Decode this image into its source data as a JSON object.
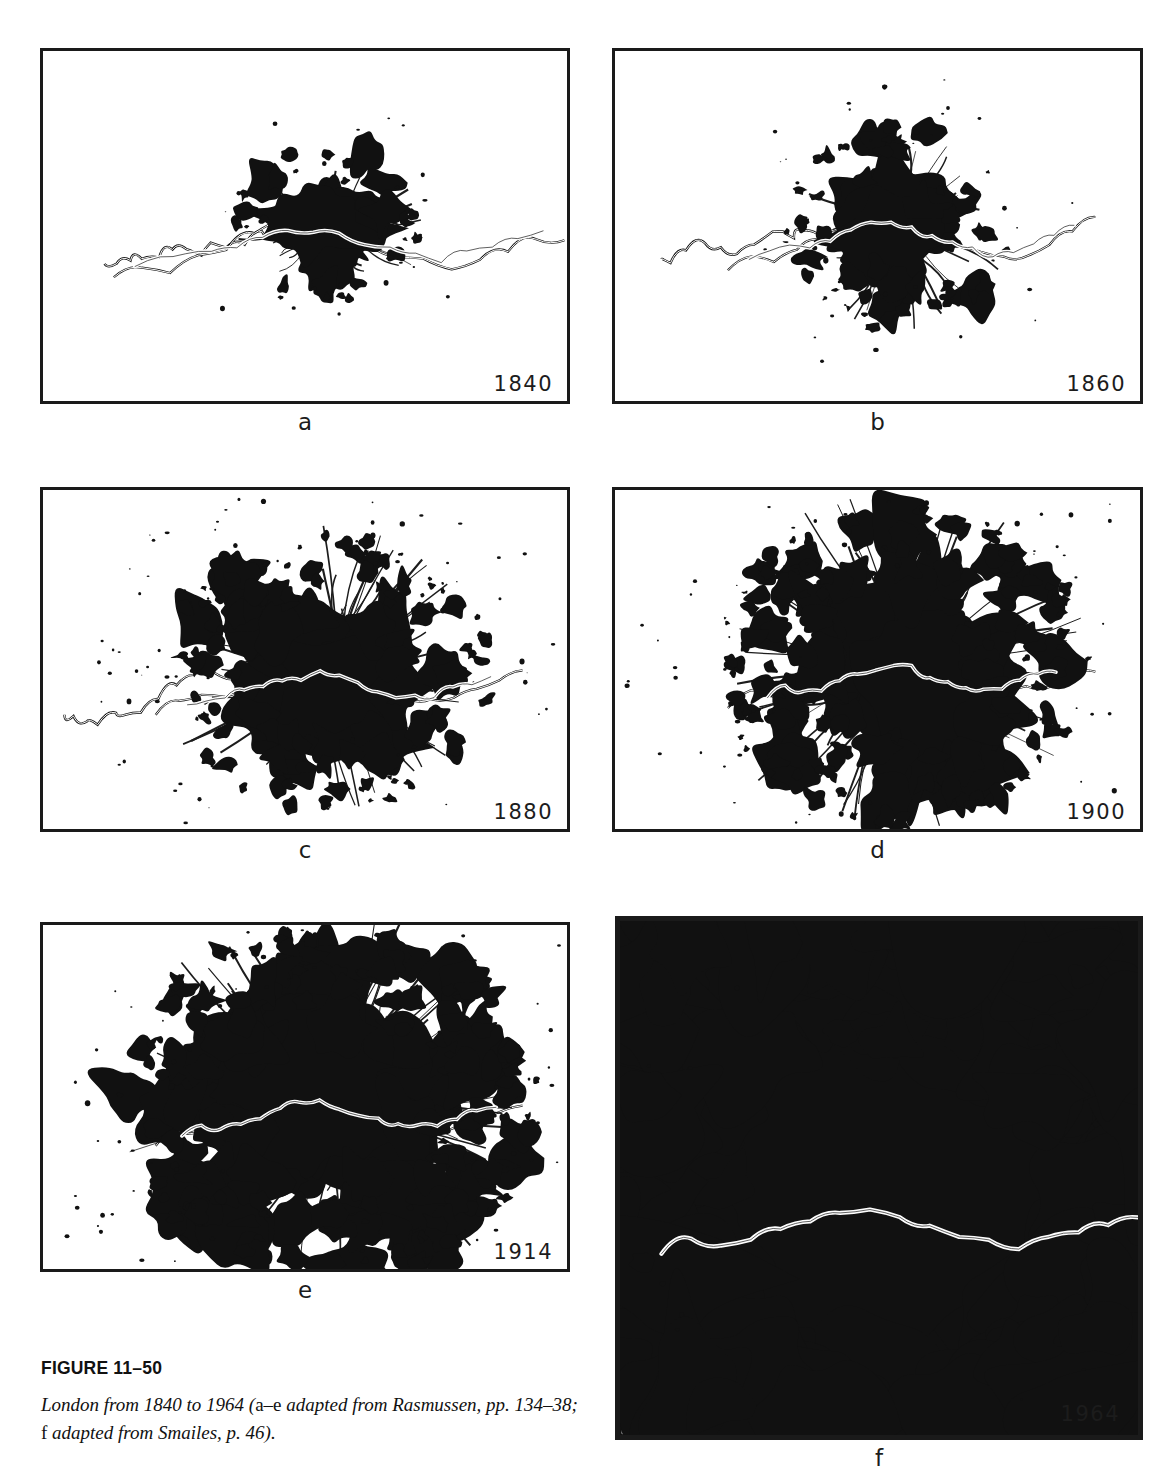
{
  "figure": {
    "number_label": "FIGURE 11–50",
    "caption_part1": "London from 1840 to 1964 (",
    "caption_roman1": "a–e",
    "caption_part2": " adapted from Rasmussen, pp. 134–38; ",
    "caption_roman2": "f",
    "caption_part3": " adapted from Smailes, p. 46)."
  },
  "panels": [
    {
      "letter": "a",
      "year": "1840"
    },
    {
      "letter": "b",
      "year": "1860"
    },
    {
      "letter": "c",
      "year": "1880"
    },
    {
      "letter": "d",
      "year": "1900"
    },
    {
      "letter": "e",
      "year": "1914"
    },
    {
      "letter": "f",
      "year": "1964"
    }
  ],
  "colors": {
    "page_background": "#ffffff",
    "built_up_area": "#111111",
    "frame": "#1a1a1a",
    "river": "#ffffff",
    "text": "#111111"
  },
  "chart_data": {
    "type": "map",
    "title": "London from 1840 to 1964",
    "symbolization": "Black = built-up urban area; white sinuous line = River Thames",
    "legend": [],
    "grid": false,
    "series": [
      {
        "name": "1840",
        "panel": "a",
        "year": 1840,
        "core_radius_units": 0.095,
        "fragment_count": 34,
        "sprawl_extent_units": 0.3,
        "description": "Compact core astride the Thames with very few outlying villages; river traced well to the west and east."
      },
      {
        "name": "1860",
        "panel": "b",
        "year": 1860,
        "core_radius_units": 0.115,
        "fragment_count": 60,
        "sprawl_extent_units": 0.36,
        "description": "Core enlarged, ragged tentacles begin to follow radial roads and railways; more scattered satellites."
      },
      {
        "name": "1880",
        "panel": "c",
        "year": 1880,
        "core_radius_units": 0.155,
        "fragment_count": 130,
        "sprawl_extent_units": 0.52,
        "description": "Markedly larger mass with many detached suburban clumps forming a broad halo."
      },
      {
        "name": "1900",
        "panel": "d",
        "year": 1900,
        "core_radius_units": 0.185,
        "fragment_count": 175,
        "sprawl_extent_units": 0.6,
        "description": "Dense continuous conurbation; suburban accretions coalescing on all sides."
      },
      {
        "name": "1914",
        "panel": "e",
        "year": 1914,
        "core_radius_units": 0.205,
        "fragment_count": 210,
        "sprawl_extent_units": 0.66,
        "description": "Continued outward spread along radial corridors with heavy peripheral infill."
      },
      {
        "name": "1964",
        "panel": "f",
        "year": 1964,
        "core_radius_units": 0.3,
        "fragment_count": 520,
        "sprawl_extent_units": 0.98,
        "description": "Vast fragmented metropolitan region filling the entire frame; dense core merging with hundreds of outlying settlements."
      }
    ]
  }
}
